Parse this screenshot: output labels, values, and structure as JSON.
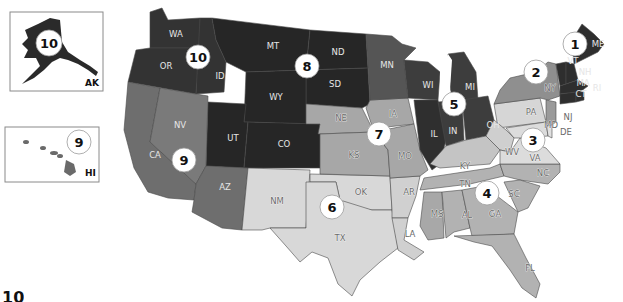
{
  "map": {
    "title": "U.S. Federal Regions",
    "colors": {
      "region_1": "#2e2e2e",
      "region_2": "#8f8f8f",
      "region_3": "#d3d3d3",
      "region_4": "#b2b2b2",
      "region_5": "#3d3d3d",
      "region_6": "#d8d8d8",
      "region_7": "#a7a7a7",
      "region_8": "#262626",
      "region_9": "#6e6e6e",
      "region_10": "#333333",
      "background": "#ffffff"
    },
    "regions": [
      {
        "number": "1",
        "states": [
          "ME",
          "VT",
          "NH",
          "MA",
          "CT",
          "RI"
        ]
      },
      {
        "number": "2",
        "states": [
          "NY",
          "NJ"
        ]
      },
      {
        "number": "3",
        "states": [
          "PA",
          "WV",
          "VA",
          "MD",
          "DE"
        ]
      },
      {
        "number": "4",
        "states": [
          "KY",
          "TN",
          "NC",
          "SC",
          "MS",
          "AL",
          "GA",
          "FL"
        ]
      },
      {
        "number": "5",
        "states": [
          "MN",
          "WI",
          "MI",
          "IL",
          "IN",
          "OH"
        ]
      },
      {
        "number": "6",
        "states": [
          "NM",
          "OK",
          "AR",
          "TX",
          "LA"
        ]
      },
      {
        "number": "7",
        "states": [
          "NE",
          "IA",
          "KS",
          "MO"
        ]
      },
      {
        "number": "8",
        "states": [
          "MT",
          "ND",
          "SD",
          "WY",
          "UT",
          "CO"
        ]
      },
      {
        "number": "9",
        "states": [
          "CA",
          "NV",
          "AZ",
          "HI"
        ]
      },
      {
        "number": "10",
        "states": [
          "WA",
          "OR",
          "ID",
          "AK"
        ]
      }
    ],
    "badges": {
      "r1": "1",
      "r2": "2",
      "r3": "3",
      "r4": "4",
      "r5": "5",
      "r6": "6",
      "r7": "7",
      "r8": "8",
      "r9": "9",
      "r10": "10",
      "ak": "10",
      "hi": "9"
    },
    "labels": {
      "WA": "WA",
      "OR": "OR",
      "ID": "ID",
      "MT": "MT",
      "ND": "ND",
      "SD": "SD",
      "WY": "WY",
      "UT": "UT",
      "CO": "CO",
      "NV": "NV",
      "CA": "CA",
      "AZ": "AZ",
      "NM": "NM",
      "OK": "OK",
      "TX": "TX",
      "AR": "AR",
      "LA": "LA",
      "NE": "NE",
      "KS": "KS",
      "IA": "IA",
      "MO": "MO",
      "MN": "MN",
      "WI": "WI",
      "MI": "MI",
      "IL": "IL",
      "IN": "IN",
      "OH": "OH",
      "KY": "KY",
      "TN": "TN",
      "MS": "MS",
      "AL": "AL",
      "GA": "GA",
      "SC": "SC",
      "NC": "NC",
      "FL": "FL",
      "VA": "VA",
      "WV": "WV",
      "PA": "PA",
      "NY": "NY",
      "NJ": "NJ",
      "MD": "MD",
      "DE": "DE",
      "ME": "ME",
      "VT": "VT",
      "NH": "NH",
      "MA": "MA",
      "CT": "CT",
      "RI": "RI"
    },
    "insets": {
      "alaska_label": "AK",
      "hawaii_label": "HI"
    },
    "footer_partial": "10"
  }
}
